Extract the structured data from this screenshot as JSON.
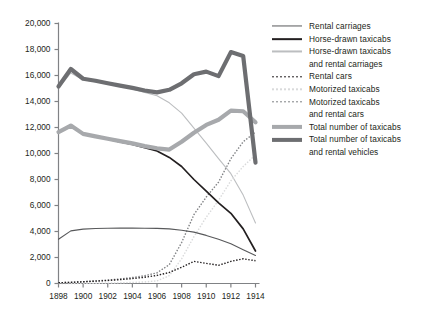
{
  "chart_data": {
    "type": "line",
    "title": "",
    "subtitle": "",
    "xlabel": "",
    "ylabel": "",
    "xlim": [
      1898,
      1914
    ],
    "ylim": [
      0,
      20000
    ],
    "grid": false,
    "legend_position": "right",
    "x": [
      1898,
      1899,
      1900,
      1901,
      1902,
      1903,
      1904,
      1905,
      1906,
      1907,
      1908,
      1909,
      1910,
      1911,
      1912,
      1913,
      1914
    ],
    "xtick_labels": [
      "1898",
      "1900",
      "1902",
      "1904",
      "1906",
      "1908",
      "1910",
      "1912",
      "1914"
    ],
    "xticks": [
      1898,
      1900,
      1902,
      1904,
      1906,
      1908,
      1910,
      1912,
      1914
    ],
    "ytick_labels": [
      "0",
      "2,000",
      "4,000",
      "6,000",
      "8,000",
      "10,000",
      "12,000",
      "14,000",
      "16,000",
      "18,000",
      "20,000"
    ],
    "yticks": [
      0,
      2000,
      4000,
      6000,
      8000,
      10000,
      12000,
      14000,
      16000,
      18000,
      20000
    ],
    "series": [
      {
        "name": "Rental carriages",
        "key": "rental_carriages",
        "style": "solid",
        "width": 1.1,
        "color": "#58595b",
        "values": [
          3400,
          4050,
          4180,
          4230,
          4250,
          4260,
          4260,
          4250,
          4240,
          4200,
          4100,
          3950,
          3700,
          3400,
          3050,
          2600,
          2150
        ]
      },
      {
        "name": "Horse-drawn taxicabs",
        "key": "horse_drawn_taxicabs",
        "style": "solid",
        "width": 1.7,
        "color": "#231f20",
        "values": [
          11650,
          12150,
          11500,
          11300,
          11100,
          10900,
          10700,
          10450,
          10200,
          9700,
          9000,
          8000,
          7100,
          6200,
          5400,
          4200,
          2500
        ]
      },
      {
        "name": "Horse-drawn taxicabs and rental carriages",
        "key": "horse_drawn_and_rental_carriages",
        "style": "solid",
        "width": 1.1,
        "color": "#bcbec0",
        "values": [
          15050,
          16200,
          15680,
          15530,
          15350,
          15160,
          14960,
          14700,
          14440,
          13900,
          13100,
          11950,
          10800,
          9600,
          8450,
          6800,
          4650
        ]
      },
      {
        "name": "Rental cars",
        "key": "rental_cars",
        "style": "dotted",
        "width": 1.4,
        "color": "#231f20",
        "values": [
          60,
          90,
          130,
          180,
          230,
          300,
          380,
          480,
          620,
          850,
          1250,
          1700,
          1550,
          1400,
          1700,
          1900,
          1750
        ]
      },
      {
        "name": "Motorized  taxicabs",
        "key": "motorized_taxicabs",
        "style": "dotted",
        "width": 1.4,
        "color": "#d9dadb",
        "values": [
          0,
          0,
          10,
          20,
          30,
          50,
          80,
          120,
          200,
          600,
          1900,
          3600,
          5100,
          6400,
          7900,
          9000,
          9900
        ]
      },
      {
        "name": "Motorized  taxicabs and rental cars",
        "key": "motorized_taxicabs_and_rental_cars",
        "style": "dotted",
        "width": 1.4,
        "color": "#808285",
        "values": [
          60,
          90,
          140,
          200,
          260,
          350,
          460,
          600,
          820,
          1450,
          3150,
          5300,
          6650,
          7800,
          9600,
          10900,
          11650
        ]
      },
      {
        "name": "Total number of taxicabs",
        "key": "total_taxicabs",
        "style": "solid",
        "width": 4.2,
        "color": "#a7a9ac",
        "values": [
          11650,
          12150,
          11510,
          11320,
          11130,
          10950,
          10780,
          10570,
          10400,
          10300,
          10900,
          11600,
          12200,
          12600,
          13300,
          13250,
          12400
        ]
      },
      {
        "name": "Total number of taxicabs and rental vehicles",
        "key": "total_taxicabs_and_rental_vehicles",
        "style": "solid",
        "width": 4.2,
        "color": "#6d6e71",
        "values": [
          15150,
          16500,
          15750,
          15600,
          15400,
          15220,
          15050,
          14850,
          14700,
          14900,
          15400,
          16100,
          16300,
          15950,
          17800,
          17500,
          9300
        ]
      }
    ]
  },
  "legend": {
    "entries": [
      {
        "label": "Rental carriages",
        "cont": ""
      },
      {
        "label": "Horse-drawn taxicabs",
        "cont": ""
      },
      {
        "label": "Horse-drawn taxicabs",
        "cont": "and rental carriages"
      },
      {
        "label": "Rental cars",
        "cont": ""
      },
      {
        "label": "Motorized  taxicabs",
        "cont": ""
      },
      {
        "label": "Motorized  taxicabs",
        "cont": "and rental cars"
      },
      {
        "label": "Total number of taxicabs",
        "cont": ""
      },
      {
        "label": "Total number of taxicabs",
        "cont": "and rental vehicles"
      }
    ]
  },
  "axis": {
    "line_color": "#808285"
  }
}
